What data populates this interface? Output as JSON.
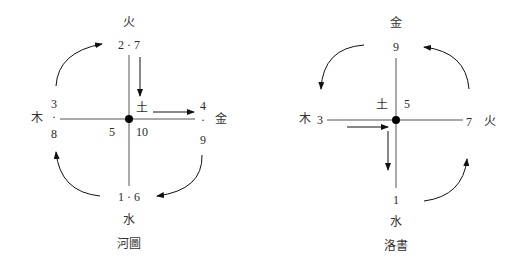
{
  "hetu": {
    "caption": "河圖",
    "top": {
      "element": "火",
      "numbers": "2 · 7"
    },
    "right": {
      "element": "金",
      "num_top": "4",
      "dot": "·",
      "num_bottom": "9"
    },
    "bottom": {
      "element": "水",
      "numbers": "1 · 6"
    },
    "left": {
      "element": "木",
      "num_top": "3",
      "dot": "·",
      "num_bottom": "8"
    },
    "center": {
      "element": "土",
      "num_left": "5",
      "num_right": "10"
    }
  },
  "luoshu": {
    "caption": "洛書",
    "top": {
      "element": "金",
      "number": "9"
    },
    "right": {
      "element": "火",
      "number": "7"
    },
    "bottom": {
      "element": "水",
      "number": "1"
    },
    "left": {
      "element": "木",
      "number": "3"
    },
    "center": {
      "element": "土",
      "number": "5"
    }
  },
  "colors": {
    "line": "#555555",
    "dot": "#000000",
    "text": "#2a2a2a"
  }
}
